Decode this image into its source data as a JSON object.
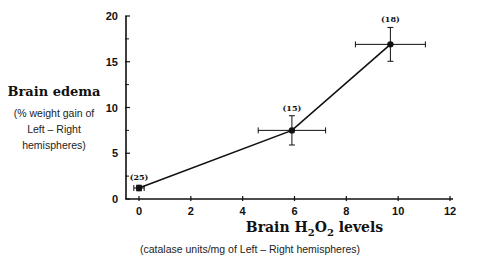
{
  "chart_data": {
    "type": "line",
    "title": "",
    "xlabel": "Brain H2O2 levels",
    "xlabel_parts": {
      "pre": "Brain H",
      "sub1": "2",
      "mid": "O",
      "sub2": "2",
      "post": " levels"
    },
    "xlabel_sub": "(catalase units/mg of Left – Right hemispheres)",
    "ylabel": "Brain edema",
    "ylabel_sub_lines": [
      "(% weight gain of",
      "Left – Right",
      "hemispheres)"
    ],
    "xlim": [
      0,
      12
    ],
    "ylim": [
      0,
      20
    ],
    "x_ticks": [
      0,
      2,
      4,
      6,
      8,
      10,
      12
    ],
    "y_ticks": [
      0,
      5,
      10,
      15,
      20
    ],
    "y_minor_ticks": [
      2.5,
      7.5,
      12.5,
      17.5
    ],
    "grid": false,
    "legend": null,
    "series": [
      {
        "name": "Brain edema vs H2O2",
        "points": [
          {
            "x": 0.0,
            "y": 1.2,
            "x_err": 0.2,
            "y_err": 0.3,
            "n_label": "(25)"
          },
          {
            "x": 5.9,
            "y": 7.5,
            "x_err": 1.3,
            "y_err": 1.6,
            "n_label": "(15)"
          },
          {
            "x": 9.7,
            "y": 16.9,
            "x_err": 1.35,
            "y_err": 1.85,
            "n_label": "(18)"
          }
        ]
      }
    ]
  },
  "colors": {
    "line": "#111111",
    "axis": "#111111",
    "background": "#ffffff"
  }
}
